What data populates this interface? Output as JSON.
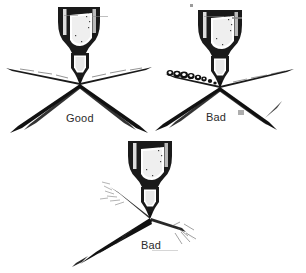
{
  "figure": {
    "background_color": "#ffffff",
    "ink_color": "#111111",
    "caption_color": "#2b2b2b",
    "width": 306,
    "height": 273
  },
  "panels": [
    {
      "id": "good",
      "caption": "Good",
      "pattern": "symmetric-even-fan",
      "description": "Spray gun nozzle producing an even, symmetric fan pattern on both sides"
    },
    {
      "id": "bad-1",
      "caption": "Bad",
      "pattern": "spattering-droplets-left",
      "description": "Spray gun nozzle producing blobby spattered droplets along the left arm of the fan"
    },
    {
      "id": "bad-2",
      "caption": "Bad",
      "pattern": "lopsided-asymmetric-fan",
      "description": "Spray gun nozzle producing a lopsided, tilted and uneven fan pattern"
    }
  ],
  "nozzle": {
    "parts": [
      "air cap",
      "fluid tip",
      "nozzle body",
      "cup shoulder"
    ]
  }
}
